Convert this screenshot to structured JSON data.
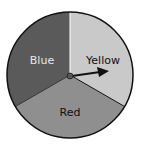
{
  "spinner": {
    "sections": [
      {
        "label": "Blue",
        "color": "#5a5a5a",
        "text_color": "#e6e6e6"
      },
      {
        "label": "Yellow",
        "color": "#c9c9c9",
        "text_color": "#111111"
      },
      {
        "label": "Red",
        "color": "#8f8f8f",
        "text_color": "#111111"
      }
    ],
    "pointer": "arrow pointing right into Yellow section",
    "outline_color": "#111111"
  }
}
